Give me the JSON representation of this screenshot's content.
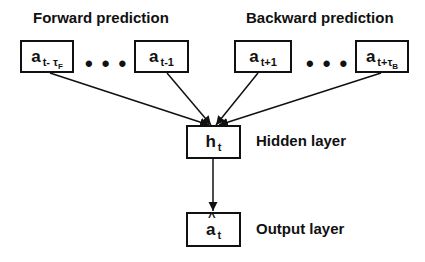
{
  "titles": {
    "forward": "Forward prediction",
    "backward": "Backward prediction"
  },
  "inputs": [
    {
      "base": "a",
      "sub": "t- τ",
      "subsub": "F"
    },
    {
      "base": "a",
      "sub": "t-1",
      "subsub": ""
    },
    {
      "base": "a",
      "sub": "t+1",
      "subsub": ""
    },
    {
      "base": "a",
      "sub": "t+τ",
      "subsub": "B"
    }
  ],
  "ellipsis": "•••",
  "hidden": {
    "base": "h",
    "sub": "t",
    "label": "Hidden layer"
  },
  "output": {
    "base": "a",
    "sub": "t",
    "label": "Output layer"
  }
}
